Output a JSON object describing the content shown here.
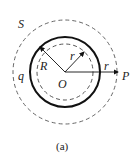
{
  "diagram": {
    "labels": {
      "surface": "S",
      "charge": "q",
      "shell_radius": "R",
      "center": "O",
      "inner_radius": "r",
      "point_radius": "r",
      "point": "P"
    },
    "caption": "(a)"
  }
}
